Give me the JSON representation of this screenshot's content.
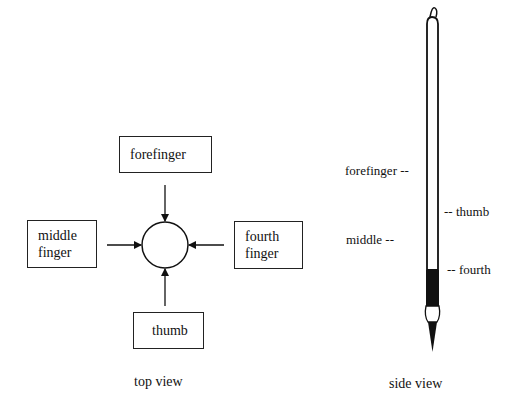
{
  "top_view": {
    "caption": "top view",
    "boxes": {
      "forefinger": [
        "forefinger"
      ],
      "middle": [
        "middle",
        "finger"
      ],
      "fourth": [
        "fourth",
        "finger"
      ],
      "thumb": [
        "thumb"
      ]
    }
  },
  "side_view": {
    "caption": "side view",
    "labels": {
      "forefinger": "forefinger --",
      "thumb": "-- thumb",
      "middle": "middle --",
      "fourth": "-- fourth"
    }
  }
}
